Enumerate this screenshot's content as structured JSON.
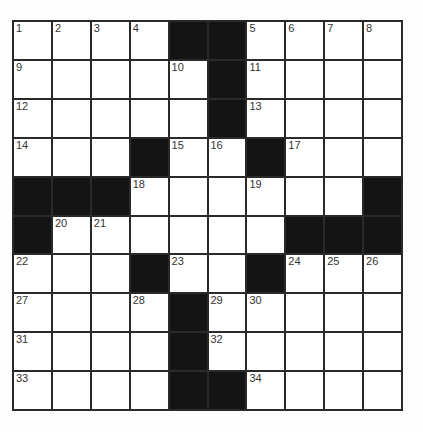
{
  "puzzle": {
    "rows": 10,
    "cols": 10,
    "colors": {
      "block": "#141414",
      "cell": "#ffffff",
      "line": "#2a2a2a"
    },
    "layout": [
      "....##....",
      ".....#....",
      ".....#....",
      "...#..#...",
      "###......#",
      "#......###",
      "...#..#...",
      "....#.....",
      "....#.....",
      "....##...."
    ],
    "numbers": [
      {
        "r": 0,
        "c": 0,
        "n": "1"
      },
      {
        "r": 0,
        "c": 1,
        "n": "2"
      },
      {
        "r": 0,
        "c": 2,
        "n": "3"
      },
      {
        "r": 0,
        "c": 3,
        "n": "4"
      },
      {
        "r": 0,
        "c": 6,
        "n": "5"
      },
      {
        "r": 0,
        "c": 7,
        "n": "6"
      },
      {
        "r": 0,
        "c": 8,
        "n": "7"
      },
      {
        "r": 0,
        "c": 9,
        "n": "8"
      },
      {
        "r": 1,
        "c": 0,
        "n": "9"
      },
      {
        "r": 1,
        "c": 4,
        "n": "10"
      },
      {
        "r": 1,
        "c": 6,
        "n": "11"
      },
      {
        "r": 2,
        "c": 0,
        "n": "12"
      },
      {
        "r": 2,
        "c": 6,
        "n": "13"
      },
      {
        "r": 3,
        "c": 0,
        "n": "14"
      },
      {
        "r": 3,
        "c": 4,
        "n": "15"
      },
      {
        "r": 3,
        "c": 5,
        "n": "16"
      },
      {
        "r": 3,
        "c": 7,
        "n": "17"
      },
      {
        "r": 4,
        "c": 3,
        "n": "18"
      },
      {
        "r": 4,
        "c": 6,
        "n": "19"
      },
      {
        "r": 5,
        "c": 1,
        "n": "20"
      },
      {
        "r": 5,
        "c": 2,
        "n": "21"
      },
      {
        "r": 6,
        "c": 0,
        "n": "22"
      },
      {
        "r": 6,
        "c": 4,
        "n": "23"
      },
      {
        "r": 6,
        "c": 7,
        "n": "24"
      },
      {
        "r": 6,
        "c": 8,
        "n": "25"
      },
      {
        "r": 6,
        "c": 9,
        "n": "26"
      },
      {
        "r": 7,
        "c": 0,
        "n": "27"
      },
      {
        "r": 7,
        "c": 3,
        "n": "28"
      },
      {
        "r": 7,
        "c": 5,
        "n": "29"
      },
      {
        "r": 7,
        "c": 6,
        "n": "30"
      },
      {
        "r": 8,
        "c": 0,
        "n": "31"
      },
      {
        "r": 8,
        "c": 5,
        "n": "32"
      },
      {
        "r": 9,
        "c": 0,
        "n": "33"
      },
      {
        "r": 9,
        "c": 6,
        "n": "34"
      }
    ]
  }
}
